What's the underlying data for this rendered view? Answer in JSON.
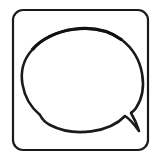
{
  "icon": {
    "name": "speech-bubble-icon",
    "frame": "rounded-square",
    "stroke_color": "#1a1a1a",
    "background": "#ffffff"
  }
}
